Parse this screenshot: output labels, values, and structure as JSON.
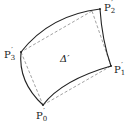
{
  "diagram": {
    "region_label": "Δ′",
    "vertices": [
      {
        "name": "P0",
        "label": "P",
        "sub": "0",
        "prime": "′"
      },
      {
        "name": "P1",
        "label": "P",
        "sub": "1",
        "prime": "′"
      },
      {
        "name": "P2",
        "label": "P",
        "sub": "2",
        "prime": "′"
      },
      {
        "name": "P3",
        "label": "P",
        "sub": "3",
        "prime": "′"
      }
    ],
    "edges": {
      "curved": "solid",
      "chords": "dashed"
    },
    "colors": {
      "curve": "#222222",
      "chord": "#888888",
      "text": "#222222"
    }
  }
}
